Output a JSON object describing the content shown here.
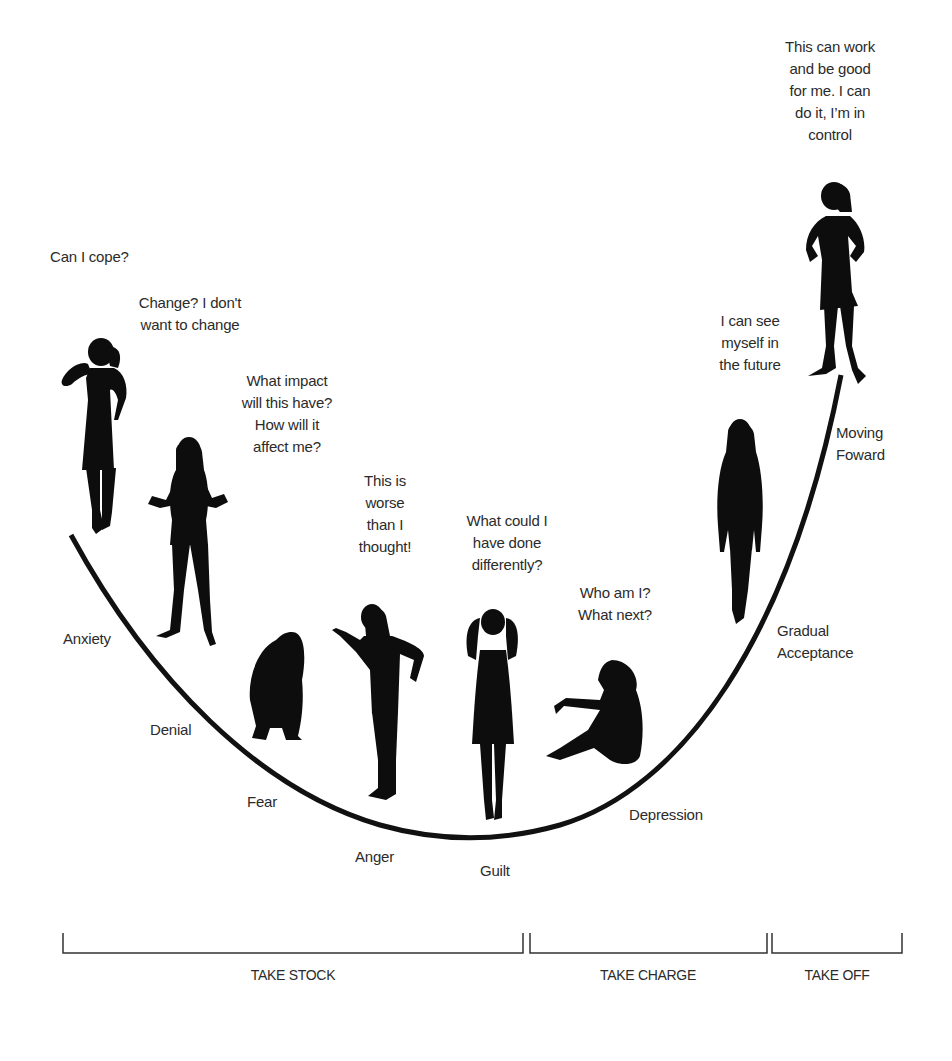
{
  "diagram": {
    "type": "change-curve",
    "curve_color": "#111111",
    "figure_color": "#0d0d0d",
    "text_color": "#2b2b2b"
  },
  "thoughts": [
    {
      "id": "anxiety",
      "text": "Can I cope?"
    },
    {
      "id": "denial",
      "text": "Change? I don't\nwant to change"
    },
    {
      "id": "fear",
      "text": "What impact\nwill this have?\nHow will it\naffect me?"
    },
    {
      "id": "anger",
      "text": "This is\nworse\nthan I\nthought!"
    },
    {
      "id": "guilt",
      "text": "What could I\nhave done\ndifferently?"
    },
    {
      "id": "depression",
      "text": "Who am I?\nWhat next?"
    },
    {
      "id": "acceptance",
      "text": "I can see\nmyself in\nthe future"
    },
    {
      "id": "moving",
      "text": "This can work\nand be good\nfor me. I can\ndo it, I’m in\ncontrol"
    }
  ],
  "stages": [
    {
      "id": "anxiety",
      "label": "Anxiety"
    },
    {
      "id": "denial",
      "label": "Denial"
    },
    {
      "id": "fear",
      "label": "Fear"
    },
    {
      "id": "anger",
      "label": "Anger"
    },
    {
      "id": "guilt",
      "label": "Guilt"
    },
    {
      "id": "depression",
      "label": "Depression"
    },
    {
      "id": "acceptance",
      "label": "Gradual\nAcceptance"
    },
    {
      "id": "moving",
      "label": "Moving\nFoward"
    }
  ],
  "phases": [
    {
      "id": "take-stock",
      "label": "TAKE STOCK"
    },
    {
      "id": "take-charge",
      "label": "TAKE CHARGE"
    },
    {
      "id": "take-off",
      "label": "TAKE OFF"
    }
  ]
}
